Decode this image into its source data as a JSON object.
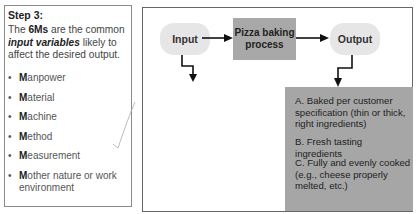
{
  "left_panel": {
    "title": "Step 3:",
    "intro_prefix": "The ",
    "intro_bold": "6Ms",
    "intro_mid": " are the common ",
    "intro_italic": "input variables",
    "intro_suffix": " likely to affect the desired output.",
    "items": [
      {
        "initial": "M",
        "rest": "anpower"
      },
      {
        "initial": "M",
        "rest": "aterial"
      },
      {
        "initial": "M",
        "rest": "achine"
      },
      {
        "initial": "M",
        "rest": "ethod"
      },
      {
        "initial": "M",
        "rest": "easurement"
      },
      {
        "initial": "M",
        "rest": "other nature or work environment"
      }
    ]
  },
  "diagram": {
    "input_label": "Input",
    "process_label": "Pizza baking process",
    "output_label": "Output",
    "outputs": [
      "A. Baked per customer specification (thin or thick, right ingredients)",
      "B. Fresh tasting ingredients",
      "C. Fully and evenly cooked (e.g., cheese properly melted, etc.)"
    ]
  },
  "colors": {
    "oval_fill": "#e6e6e6",
    "process_fill": "#a8a8a8",
    "output_box_fill": "#a6a6a6",
    "border": "#666666"
  }
}
